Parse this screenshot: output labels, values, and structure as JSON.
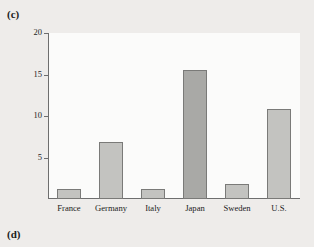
{
  "figure": {
    "panel_label_c": "(c)",
    "panel_label_d": "(d)"
  },
  "chart_data": {
    "type": "bar",
    "title": "",
    "xlabel": "",
    "ylabel": "",
    "categories": [
      "France",
      "Germany",
      "Italy",
      "Japan",
      "Sweden",
      "U.S."
    ],
    "values": [
      1.2,
      6.9,
      1.2,
      15.5,
      1.8,
      10.8
    ],
    "ylim": [
      0,
      20
    ],
    "yticks": [
      5,
      10,
      15,
      20
    ],
    "ytick_labels": [
      "5",
      "10",
      "15",
      "20"
    ],
    "grid": false,
    "legend": null,
    "bar_fill": "#c3c3c0",
    "bar_fill_emphasis": "#a9a9a6",
    "bar_edge": "#7a7a78",
    "plot_background": "#fbfbfa",
    "figure_background": "#eeecea",
    "axis_color": "#6e6e6e",
    "emphasized_categories": [
      "Japan"
    ]
  }
}
